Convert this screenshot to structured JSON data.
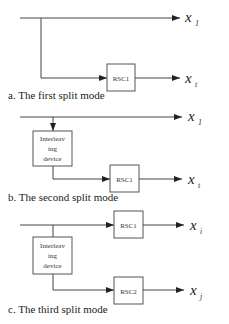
{
  "diagram": {
    "panels": [
      {
        "id": "a",
        "caption": "a. The first split mode",
        "outputs": [
          {
            "var": "x",
            "sub": "1"
          },
          {
            "var": "x",
            "sub": "t"
          }
        ],
        "blocks": [
          {
            "label": "RSC1"
          }
        ]
      },
      {
        "id": "b",
        "caption": "b. The second split mode",
        "outputs": [
          {
            "var": "x",
            "sub": "1"
          },
          {
            "var": "x",
            "sub": "t"
          }
        ],
        "blocks": [
          {
            "label_lines": [
              "Interleav",
              "ing",
              "device"
            ]
          },
          {
            "label": "RSC1"
          }
        ]
      },
      {
        "id": "c",
        "caption": "c. The third split mode",
        "outputs": [
          {
            "var": "x",
            "sub": "i"
          },
          {
            "var": "x",
            "sub": "j"
          }
        ],
        "blocks": [
          {
            "label": "RSC1"
          },
          {
            "label_lines": [
              "Interleav",
              "ing",
              "device"
            ]
          },
          {
            "label": "RSC2"
          }
        ]
      }
    ]
  }
}
